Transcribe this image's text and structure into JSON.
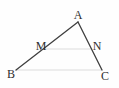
{
  "figure": {
    "background_color": "#fefefe",
    "dark_line_color": "#3f3f3f",
    "light_line_color": "#dcdcdc",
    "label_color": "#2e2e2e",
    "points": {
      "A": {
        "x": 78,
        "y": 22
      },
      "B": {
        "x": 16,
        "y": 70
      },
      "C": {
        "x": 102,
        "y": 70
      },
      "M": {
        "x": 43,
        "y": 49
      },
      "N": {
        "x": 92,
        "y": 49
      }
    },
    "dark_segments": [
      [
        "B",
        "A"
      ],
      [
        "A",
        "C"
      ]
    ],
    "light_segments": [
      [
        "M",
        "N"
      ],
      [
        "B",
        "C"
      ]
    ],
    "labels": [
      {
        "text": "A",
        "x": 78,
        "y": 19,
        "anchor": "middle"
      },
      {
        "text": "B",
        "x": 11,
        "y": 78,
        "anchor": "middle"
      },
      {
        "text": "C",
        "x": 105,
        "y": 80,
        "anchor": "middle"
      },
      {
        "text": "M",
        "x": 41,
        "y": 50,
        "anchor": "middle"
      },
      {
        "text": "N",
        "x": 97,
        "y": 50,
        "anchor": "middle"
      }
    ]
  }
}
